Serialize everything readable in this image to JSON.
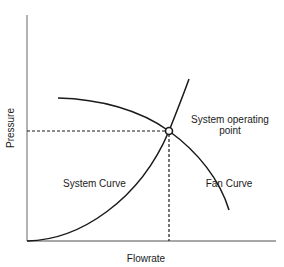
{
  "diagram": {
    "type": "fan-system-curve",
    "axes": {
      "x_label": "Flowrate",
      "y_label": "Pressure"
    },
    "curves": {
      "system_curve_label": "System Curve",
      "fan_curve_label": "Fan Curve"
    },
    "operating_point": {
      "label_line1": "System operating",
      "label_line2": "point"
    }
  },
  "colors": {
    "axis": "#8a8a8a",
    "curve": "#1a1a1a",
    "dashed": "#1a1a1a",
    "background": "#ffffff"
  }
}
